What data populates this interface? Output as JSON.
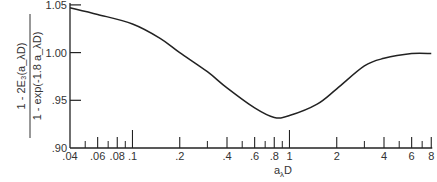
{
  "chart_data": {
    "type": "line",
    "title": "",
    "xlabel": "a_λD",
    "ylabel": "[1 - 2E₃(a_λD)] / [1 - exp(-1.8 a_λD)]",
    "ylabel_numerator": "1 - 2E₃(a_λD)",
    "ylabel_denominator": "1 - exp(-1.8 a_λD)",
    "xscale": "log",
    "xlim": [
      0.04,
      8
    ],
    "ylim": [
      0.9,
      1.05
    ],
    "grid": false,
    "legend": null,
    "x_tick_labels": [
      ".04",
      ".06",
      ".08",
      ".1",
      ".2",
      ".4",
      ".6",
      ".8",
      "1",
      "2",
      "4",
      "6",
      "8"
    ],
    "x_ticks": [
      0.04,
      0.06,
      0.08,
      0.1,
      0.2,
      0.4,
      0.6,
      0.8,
      1,
      2,
      4,
      6,
      8
    ],
    "x_minor_ticks": [
      0.05,
      0.07,
      0.09,
      0.3,
      0.5,
      0.7,
      0.9,
      3,
      5,
      7
    ],
    "y_tick_labels": [
      ".90",
      ".95",
      "1.00",
      "1.05"
    ],
    "y_ticks": [
      0.9,
      0.95,
      1.0,
      1.05
    ],
    "series": [
      {
        "name": "ratio",
        "x": [
          0.04,
          0.06,
          0.1,
          0.15,
          0.2,
          0.3,
          0.4,
          0.6,
          0.8,
          1,
          1.5,
          2,
          3,
          4,
          6,
          8
        ],
        "y": [
          1.047,
          1.04,
          1.03,
          1.015,
          1.0,
          0.98,
          0.963,
          0.942,
          0.932,
          0.934,
          0.946,
          0.962,
          0.986,
          0.994,
          0.999,
          0.999
        ]
      }
    ]
  }
}
